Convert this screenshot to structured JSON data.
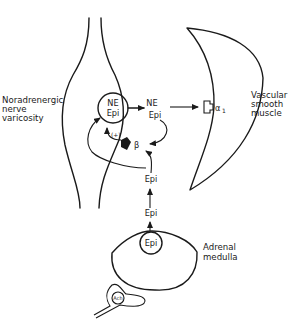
{
  "diagram": {
    "labels": {
      "nerve": [
        "Noradrenergic",
        "nerve",
        "varicosity"
      ],
      "muscle": [
        "Vascular",
        "smooth",
        "muscle"
      ],
      "adrenal": [
        "Adrenal",
        "medulla"
      ]
    },
    "vesicle": {
      "line1": "NE",
      "line2": "Epi"
    },
    "released": {
      "line1": "NE",
      "line2": "Epi"
    },
    "receptors": {
      "alpha": "α",
      "alpha_sub": "1",
      "beta": "β",
      "plus": "(+)"
    },
    "circulating": {
      "upper": "Epi",
      "lower": "Epi"
    },
    "adrenal_vesicle": "Epi",
    "preganglionic_vesicle": "Ach"
  }
}
